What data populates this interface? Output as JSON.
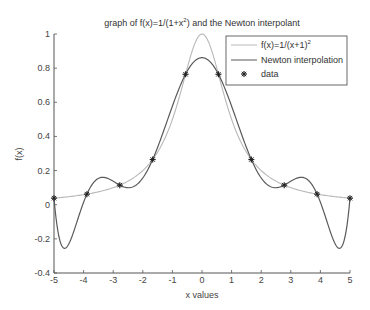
{
  "chart_data": {
    "type": "line",
    "title_parts": {
      "pre": "graph of f(x)=1/(1+x",
      "sup": "2",
      "post": ") and the Newton interpolant"
    },
    "xlabel": "x values",
    "ylabel": "f(x)",
    "xlim": [
      -5,
      5
    ],
    "ylim": [
      -0.4,
      1
    ],
    "grid": false,
    "legend_position": "upper right",
    "xticks": [
      -5,
      -4,
      -3,
      -2,
      -1,
      0,
      1,
      2,
      3,
      4,
      5
    ],
    "xtick_labels": [
      "-5",
      "-4",
      "-3",
      "-2",
      "-1",
      "0",
      "1",
      "2",
      "3",
      "4",
      "5"
    ],
    "yticks": [
      -0.4,
      -0.2,
      0,
      0.2,
      0.4,
      0.6,
      0.8,
      1
    ],
    "ytick_labels": [
      "-0.4",
      "-0.2",
      "0",
      "0.2",
      "0.4",
      "0.6",
      "0.8",
      "1"
    ],
    "series": [
      {
        "name": "f(x)=1/(x+1)^2",
        "legend_parts": {
          "pre": "f(x)=1/(x+1)",
          "sup": "2"
        },
        "kind": "function",
        "function": "1/(1+x^2)",
        "color": "#b8b8b8",
        "samples": 201
      },
      {
        "name": "Newton interpolation",
        "kind": "newton_interpolant",
        "color": "#5a5a5a",
        "samples": 301
      },
      {
        "name": "data",
        "kind": "markers",
        "marker": "*",
        "color": "#222222",
        "x": [
          -5,
          -3.8889,
          -2.7778,
          -1.6667,
          -0.5556,
          0.5556,
          1.6667,
          2.7778,
          3.8889,
          5
        ],
        "y": [
          0.0385,
          0.062,
          0.1147,
          0.2647,
          0.7642,
          0.7642,
          0.2647,
          0.1147,
          0.062,
          0.0385
        ]
      }
    ],
    "annotations": {
      "interpolant_peak_at_0": 0.86,
      "interpolant_min_near_x_-4.6": -0.25,
      "interpolant_min_near_x_4.6": -0.25
    }
  },
  "legend": {
    "items": [
      {
        "label": "f(x)=1/(x+1)",
        "sup": "2"
      },
      {
        "label": "Newton interpolation"
      },
      {
        "label": "data"
      }
    ]
  }
}
